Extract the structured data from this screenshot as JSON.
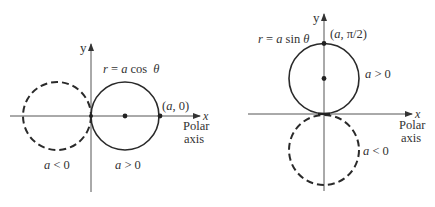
{
  "figures": [
    {
      "id": "cosine",
      "equation": {
        "r": "r",
        "eq": " = ",
        "a": "a",
        "func": " cos ",
        "theta": "θ"
      },
      "point_label": {
        "open": "(",
        "a": "a",
        "rest": ", 0)"
      },
      "axis_x_label": "x",
      "axis_y_label": "y",
      "polar_axis_label": [
        "Polar",
        "axis"
      ],
      "region_negative": {
        "a": "a",
        "rest": " < 0"
      },
      "region_positive": {
        "a": "a",
        "rest": " > 0"
      }
    },
    {
      "id": "sine",
      "equation": {
        "r": "r",
        "eq": " = ",
        "a": "a",
        "func": " sin ",
        "theta": "θ"
      },
      "point_label": {
        "open": "(",
        "a": "a",
        "rest": ", π/2)"
      },
      "axis_x_label": "x",
      "axis_y_label": "y",
      "polar_axis_label": [
        "Polar",
        "axis"
      ],
      "region_positive": {
        "a": "a",
        "rest": " > 0"
      },
      "region_negative": {
        "a": "a",
        "rest": " < 0"
      }
    }
  ],
  "colors": {
    "axis": "#555555",
    "curve": "#2a2a2a",
    "text": "#333333"
  }
}
